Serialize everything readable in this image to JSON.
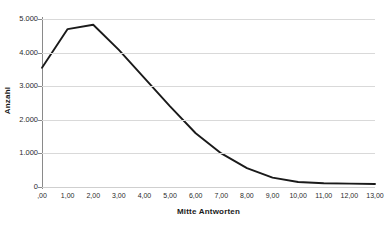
{
  "chart_data": {
    "type": "line",
    "title": "",
    "subtitle": "",
    "xlabel": "Mitte Antworten",
    "ylabel": "Anzahl",
    "x": [
      0,
      1,
      2,
      3,
      4,
      5,
      6,
      7,
      8,
      9,
      10,
      11,
      12,
      13
    ],
    "categories": [
      ",00",
      "1,00",
      "2,00",
      "3,00",
      "4,00",
      "5,00",
      "6,00",
      "7,00",
      "8,00",
      "9,00",
      "10,00",
      "11,00",
      "12,00",
      "13,00"
    ],
    "values": [
      3550,
      4700,
      4830,
      4080,
      3240,
      2400,
      1600,
      1000,
      560,
      280,
      150,
      110,
      100,
      90
    ],
    "series": [
      {
        "name": "Anzahl",
        "values": [
          3550,
          4700,
          4830,
          4080,
          3240,
          2400,
          1600,
          1000,
          560,
          280,
          150,
          110,
          100,
          90
        ],
        "color": "#1a1a1a"
      }
    ],
    "xlim": [
      0,
      13
    ],
    "ylim": [
      0,
      5000
    ],
    "y_ticks": [
      0,
      1000,
      2000,
      3000,
      4000,
      5000
    ],
    "y_tick_labels": [
      "0",
      "1.000",
      "2.000",
      "3.000",
      "4.000",
      "5.000"
    ],
    "x_ticks": [
      0,
      1,
      2,
      3,
      4,
      5,
      6,
      7,
      8,
      9,
      10,
      11,
      12,
      13
    ],
    "x_tick_labels": [
      ",00",
      "1,00",
      "2,00",
      "3,00",
      "4,00",
      "5,00",
      "6,00",
      "7,00",
      "8,00",
      "9,00",
      "10,00",
      "11,00",
      "12,00",
      "13,00"
    ],
    "grid": "horizontal",
    "legend": "none",
    "line_color": "#1a1a1a",
    "grid_color": "#d9d9d9",
    "axis_color": "#8a8a8a",
    "background": "#ffffff"
  }
}
